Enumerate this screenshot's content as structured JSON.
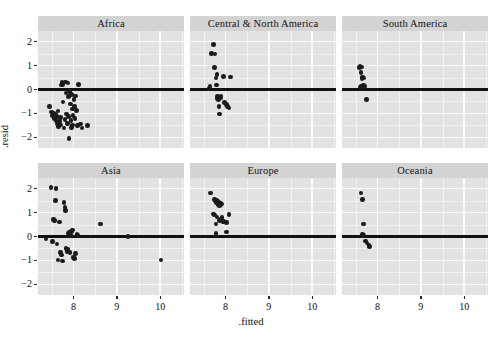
{
  "chart_data": {
    "type": "scatter",
    "title": "",
    "xlabel": ".fitted",
    "ylabel": ".resid",
    "xlim": [
      7.18,
      10.55
    ],
    "ylim": [
      -2.45,
      2.45
    ],
    "xticks": [
      8,
      9,
      10
    ],
    "yticks": [
      2,
      1,
      0,
      -1,
      -2
    ],
    "xtick_labels": [
      "8",
      "9",
      "10"
    ],
    "ytick_labels": [
      "2",
      "1",
      "0",
      "−1",
      "−2"
    ],
    "grid": true,
    "legend": "none",
    "reference_line_y": 0,
    "facet_layout": {
      "rows": 2,
      "cols": 3
    },
    "facets": [
      {
        "label": "Africa",
        "points": [
          [
            7.44,
            -0.72
          ],
          [
            7.49,
            -0.95
          ],
          [
            7.52,
            -1.08
          ],
          [
            7.55,
            -0.98
          ],
          [
            7.56,
            -1.22
          ],
          [
            7.58,
            -1.05
          ],
          [
            7.6,
            -1.3
          ],
          [
            7.62,
            -1.12
          ],
          [
            7.63,
            -1.45
          ],
          [
            7.64,
            -0.9
          ],
          [
            7.66,
            -1.55
          ],
          [
            7.68,
            -1.35
          ],
          [
            7.7,
            -1.18
          ],
          [
            7.71,
            0.18
          ],
          [
            7.73,
            0.3
          ],
          [
            7.75,
            0.22
          ],
          [
            7.76,
            -0.52
          ],
          [
            7.78,
            -1.62
          ],
          [
            7.8,
            -1.25
          ],
          [
            7.81,
            0.32
          ],
          [
            7.83,
            -0.15
          ],
          [
            7.84,
            -1.02
          ],
          [
            7.86,
            -1.42
          ],
          [
            7.87,
            0.28
          ],
          [
            7.88,
            -0.3
          ],
          [
            7.89,
            -1.12
          ],
          [
            7.9,
            -2.05
          ],
          [
            7.91,
            -0.08
          ],
          [
            7.93,
            -0.6
          ],
          [
            7.94,
            -1.3
          ],
          [
            7.95,
            -1.58
          ],
          [
            7.96,
            -0.22
          ],
          [
            7.97,
            -0.82
          ],
          [
            7.98,
            -1.48
          ],
          [
            7.99,
            -1.08
          ],
          [
            8.01,
            -0.42
          ],
          [
            8.02,
            -0.7
          ],
          [
            8.03,
            -1.22
          ],
          [
            8.05,
            -0.28
          ],
          [
            8.07,
            -0.88
          ],
          [
            8.09,
            -1.52
          ],
          [
            8.12,
            0.2
          ],
          [
            8.16,
            -1.45
          ],
          [
            8.2,
            -1.62
          ],
          [
            8.32,
            -1.5
          ],
          [
            7.7,
            -1.48
          ]
        ]
      },
      {
        "label": "Central & North America",
        "points": [
          [
            7.62,
            0.05
          ],
          [
            7.64,
            0.12
          ],
          [
            7.68,
            1.52
          ],
          [
            7.72,
            1.88
          ],
          [
            7.74,
            0.92
          ],
          [
            7.76,
            1.48
          ],
          [
            7.78,
            0.48
          ],
          [
            7.79,
            0.18
          ],
          [
            7.8,
            0.62
          ],
          [
            7.81,
            -0.38
          ],
          [
            7.82,
            -0.3
          ],
          [
            7.84,
            -0.42
          ],
          [
            7.85,
            -0.72
          ],
          [
            7.86,
            -1.02
          ],
          [
            7.88,
            -0.35
          ],
          [
            7.9,
            -0.28
          ],
          [
            7.96,
            0.55
          ],
          [
            7.98,
            -0.55
          ],
          [
            8.02,
            -0.62
          ],
          [
            8.05,
            -0.7
          ],
          [
            8.08,
            -0.78
          ],
          [
            8.12,
            0.52
          ]
        ]
      },
      {
        "label": "South America",
        "points": [
          [
            7.58,
            0.92
          ],
          [
            7.6,
            0.98
          ],
          [
            7.63,
            0.95
          ],
          [
            7.62,
            0.72
          ],
          [
            7.64,
            0.45
          ],
          [
            7.66,
            0.52
          ],
          [
            7.68,
            0.48
          ],
          [
            7.67,
            0.18
          ],
          [
            7.62,
            0.15
          ],
          [
            7.65,
            0.1
          ],
          [
            7.7,
            0.12
          ],
          [
            7.6,
            0.08
          ],
          [
            7.75,
            -0.42
          ]
        ]
      },
      {
        "label": "Asia",
        "points": [
          [
            7.36,
            -0.1
          ],
          [
            7.48,
            2.05
          ],
          [
            7.52,
            -0.22
          ],
          [
            7.54,
            0.7
          ],
          [
            7.56,
            0.68
          ],
          [
            7.58,
            1.52
          ],
          [
            7.6,
            2.02
          ],
          [
            7.62,
            -0.32
          ],
          [
            7.64,
            -0.98
          ],
          [
            7.68,
            0.6
          ],
          [
            7.7,
            -0.68
          ],
          [
            7.72,
            -0.78
          ],
          [
            7.74,
            -1.02
          ],
          [
            7.78,
            1.42
          ],
          [
            7.8,
            1.22
          ],
          [
            7.82,
            1.08
          ],
          [
            7.83,
            -0.5
          ],
          [
            7.85,
            -0.62
          ],
          [
            7.87,
            -0.55
          ],
          [
            7.88,
            0.12
          ],
          [
            7.9,
            0.18
          ],
          [
            7.92,
            -0.68
          ],
          [
            7.95,
            0.22
          ],
          [
            7.96,
            0.02
          ],
          [
            7.98,
            0.28
          ],
          [
            8.0,
            -0.88
          ],
          [
            8.02,
            -0.92
          ],
          [
            8.04,
            -0.72
          ],
          [
            8.08,
            0.08
          ],
          [
            8.1,
            0.05
          ],
          [
            8.62,
            0.52
          ],
          [
            9.26,
            0.0
          ],
          [
            10.02,
            -0.98
          ]
        ]
      },
      {
        "label": "Europe",
        "points": [
          [
            7.66,
            1.82
          ],
          [
            7.74,
            1.55
          ],
          [
            7.76,
            1.48
          ],
          [
            7.78,
            1.42
          ],
          [
            7.8,
            1.52
          ],
          [
            7.82,
            1.46
          ],
          [
            7.83,
            1.38
          ],
          [
            7.84,
            1.32
          ],
          [
            7.85,
            1.45
          ],
          [
            7.86,
            1.28
          ],
          [
            7.88,
            1.4
          ],
          [
            7.9,
            1.34
          ],
          [
            7.92,
            1.36
          ],
          [
            7.72,
            0.95
          ],
          [
            7.74,
            0.9
          ],
          [
            7.8,
            0.82
          ],
          [
            7.86,
            0.68
          ],
          [
            7.88,
            0.72
          ],
          [
            7.92,
            0.8
          ],
          [
            7.94,
            0.62
          ],
          [
            7.78,
            0.52
          ],
          [
            7.96,
            0.62
          ],
          [
            8.02,
            0.58
          ],
          [
            8.08,
            0.92
          ],
          [
            7.78,
            0.12
          ],
          [
            8.02,
            0.18
          ]
        ]
      },
      {
        "label": "Oceania",
        "points": [
          [
            7.62,
            1.82
          ],
          [
            7.66,
            1.55
          ],
          [
            7.68,
            0.52
          ],
          [
            7.66,
            0.08
          ],
          [
            7.68,
            0.05
          ],
          [
            7.72,
            -0.18
          ],
          [
            7.76,
            -0.28
          ],
          [
            7.8,
            -0.38
          ],
          [
            7.82,
            -0.42
          ]
        ]
      }
    ]
  },
  "axis": {
    "y_title": ".resid",
    "x_title": ".fitted"
  },
  "caption": ""
}
